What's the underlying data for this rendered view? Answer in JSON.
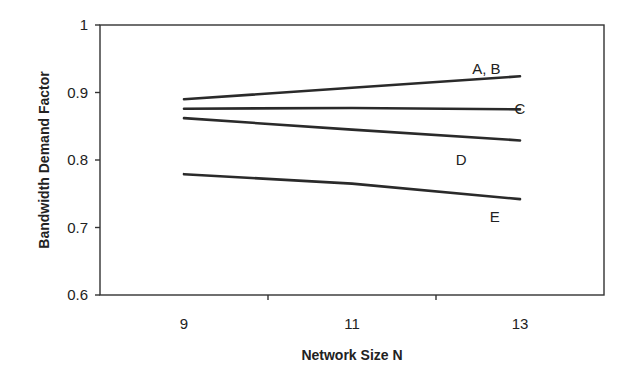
{
  "chart_data": {
    "type": "line",
    "title": "",
    "xlabel": "Network Size N",
    "ylabel": "Bandwidth Demand Factor",
    "x": [
      9,
      11,
      13
    ],
    "xlim": [
      8,
      14
    ],
    "ylim": [
      0.6,
      1.0
    ],
    "xticks": [
      9,
      11,
      13
    ],
    "yticks": [
      0.6,
      0.7,
      0.8,
      0.9,
      1.0
    ],
    "xtick_labels": [
      "9",
      "11",
      "13"
    ],
    "ytick_labels": [
      "0.6",
      "0.7",
      "0.8",
      "0.9",
      "1"
    ],
    "grid": false,
    "legend": "inline labels at line ends",
    "series": [
      {
        "name": "A, B",
        "values": [
          0.89,
          0.907,
          0.924
        ]
      },
      {
        "name": "C",
        "values": [
          0.876,
          0.877,
          0.875
        ]
      },
      {
        "name": "D",
        "values": [
          0.862,
          0.845,
          0.829
        ]
      },
      {
        "name": "E",
        "values": [
          0.779,
          0.765,
          0.742
        ]
      }
    ],
    "annotations": [
      {
        "text": "A, B",
        "x": 12.6,
        "y": 0.935
      },
      {
        "text": "C",
        "x": 13.0,
        "y": 0.875
      },
      {
        "text": "D",
        "x": 12.3,
        "y": 0.8
      },
      {
        "text": "E",
        "x": 12.7,
        "y": 0.715
      }
    ]
  }
}
